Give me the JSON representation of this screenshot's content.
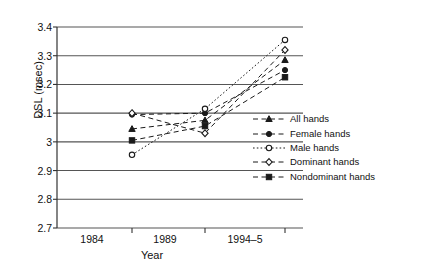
{
  "chart_data": {
    "type": "line",
    "title": "",
    "xlabel": "Year",
    "ylabel": "DSL (msec)",
    "categories": [
      "1984",
      "1989",
      "1994–5"
    ],
    "x_positions": [
      92,
      165,
      245
    ],
    "ylim": [
      2.7,
      3.4
    ],
    "yticks": [
      "3.4",
      "3.3",
      "3.2",
      "3.1",
      "3",
      "2.9",
      "2.8",
      "2.7"
    ],
    "ytick_values": [
      3.4,
      3.3,
      3.2,
      3.1,
      3.0,
      2.9,
      2.8,
      2.7
    ],
    "grid": true,
    "legend_position": "right",
    "series": [
      {
        "name": "All hands",
        "marker": "triangle-filled",
        "line": "dashed",
        "values": [
          3.045,
          3.075,
          3.285
        ]
      },
      {
        "name": "Female hands",
        "marker": "circle-filled",
        "line": "dashed",
        "values": [
          3.095,
          3.1,
          3.25
        ]
      },
      {
        "name": "Male hands",
        "marker": "circle-open",
        "line": "dotted",
        "values": [
          2.955,
          3.115,
          3.355
        ]
      },
      {
        "name": "Dominant hands",
        "marker": "diamond-open",
        "line": "dashed",
        "values": [
          3.1,
          3.03,
          3.32
        ]
      },
      {
        "name": "Nondominant hands",
        "marker": "square-filled",
        "line": "dashed",
        "values": [
          3.005,
          3.055,
          3.225
        ]
      }
    ]
  },
  "legend": {
    "items": [
      {
        "label": "All hands"
      },
      {
        "label": "Female hands"
      },
      {
        "label": "Male hands"
      },
      {
        "label": "Dominant hands"
      },
      {
        "label": "Nondominant hands"
      }
    ]
  },
  "axes": {
    "ylabel": "DSL (msec)",
    "xlabel": "Year"
  },
  "colors": {
    "line": "#1a1a1a",
    "grid": "#555555",
    "background": "#ffffff",
    "text": "#111111"
  }
}
